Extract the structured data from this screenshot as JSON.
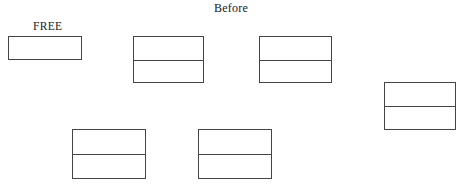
{
  "diagram": {
    "title": "Before",
    "free_label": "FREE",
    "line_color": "#444444",
    "blocks": [
      {
        "id": "free-block",
        "type": "free",
        "sections": 1,
        "x": 8,
        "y": 36,
        "w": 74,
        "h": 24
      },
      {
        "id": "allocated-block-1",
        "type": "allocated",
        "sections": 2,
        "x": 133,
        "y": 36,
        "w": 71,
        "h": 47
      },
      {
        "id": "allocated-block-2",
        "type": "allocated",
        "sections": 2,
        "x": 259,
        "y": 36,
        "w": 73,
        "h": 47
      },
      {
        "id": "allocated-block-3",
        "type": "allocated",
        "sections": 2,
        "x": 384,
        "y": 82,
        "w": 72,
        "h": 48
      },
      {
        "id": "allocated-block-4",
        "type": "allocated",
        "sections": 2,
        "x": 72,
        "y": 129,
        "w": 74,
        "h": 50
      },
      {
        "id": "allocated-block-5",
        "type": "allocated",
        "sections": 2,
        "x": 198,
        "y": 129,
        "w": 74,
        "h": 50
      }
    ]
  }
}
